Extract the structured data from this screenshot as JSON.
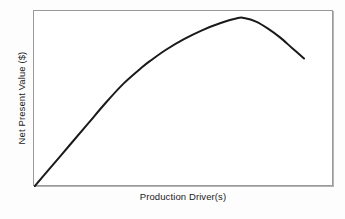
{
  "chart_data": {
    "type": "line",
    "title": "",
    "subtitle": "",
    "xlabel": "Production Driver(s)",
    "ylabel": "Net Present Value ($)",
    "xtick_labels": [],
    "ytick_labels": [],
    "grid": false,
    "legend": null,
    "legend_position": "none",
    "xlim": [
      0,
      100
    ],
    "ylim": [
      0,
      100
    ],
    "annotations": [],
    "axes_note": "Conceptual schematic curve; axes are unlabeled with no numeric tick marks.",
    "series": [
      {
        "name": "Net Present Value",
        "color": "#1a1a1a",
        "line_width_px": 2,
        "description": "Rises approximately linearly from the origin, curves over to a maximum, then declines.",
        "x": [
          0,
          6,
          12,
          18,
          24,
          30,
          36,
          39,
          44,
          50,
          56,
          62,
          68,
          70,
          74,
          78,
          82,
          86,
          90
        ],
        "y": [
          0,
          12,
          24,
          36,
          48,
          59,
          68,
          72,
          78,
          84,
          89,
          93,
          96,
          96,
          94,
          90,
          85,
          79,
          73
        ]
      }
    ]
  },
  "figure": {
    "frame": {
      "border_color": "#9a9a9a",
      "fill_color": "#ffffff"
    },
    "background_color": "#fdfdfd",
    "curve_color": "#1a1a1a"
  }
}
